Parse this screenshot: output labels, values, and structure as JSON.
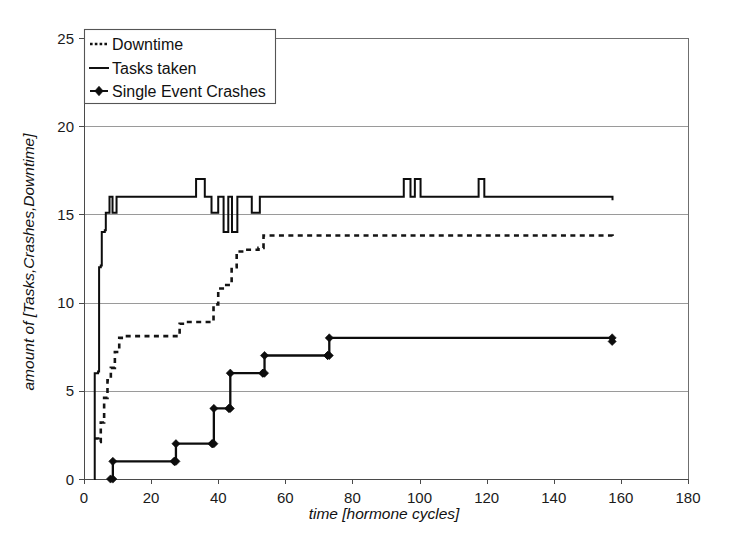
{
  "chart_data": {
    "type": "line",
    "title": "",
    "xlabel": "time [hormone cycles]",
    "ylabel": "amount of [Tasks,Crashes,Downtime]",
    "xlim": [
      0,
      180
    ],
    "ylim": [
      0,
      25
    ],
    "xticks": [
      0,
      20,
      40,
      60,
      80,
      100,
      120,
      140,
      160,
      180
    ],
    "yticks": [
      0,
      5,
      10,
      15,
      20,
      25
    ],
    "grid": "horizontal",
    "legend_position": "top-left",
    "series": [
      {
        "name": "Downtime",
        "style": "dotted",
        "marker": "none",
        "step": "post",
        "points": [
          [
            3.0,
            2.3
          ],
          [
            4.2,
            2.1
          ],
          [
            5.0,
            3.2
          ],
          [
            6.0,
            4.6
          ],
          [
            7.0,
            5.6
          ],
          [
            8.0,
            6.3
          ],
          [
            9.2,
            7.2
          ],
          [
            10.5,
            8.0
          ],
          [
            11.8,
            8.1
          ],
          [
            27.0,
            8.1
          ],
          [
            28.5,
            8.8
          ],
          [
            30.0,
            8.9
          ],
          [
            37.5,
            8.9
          ],
          [
            38.6,
            9.9
          ],
          [
            40.0,
            10.8
          ],
          [
            42.0,
            11.0
          ],
          [
            44.0,
            12.0
          ],
          [
            45.5,
            12.9
          ],
          [
            48.0,
            13.0
          ],
          [
            52.0,
            13.1
          ],
          [
            53.5,
            13.8
          ],
          [
            157.5,
            13.75
          ]
        ]
      },
      {
        "name": "Tasks taken",
        "style": "solid",
        "marker": "none",
        "step": "post",
        "points": [
          [
            3.0,
            0.0
          ],
          [
            3.2,
            6.0
          ],
          [
            4.2,
            6.1
          ],
          [
            4.5,
            12.0
          ],
          [
            5.0,
            12.1
          ],
          [
            5.3,
            14.0
          ],
          [
            6.2,
            14.1
          ],
          [
            6.5,
            15.1
          ],
          [
            7.3,
            15.1
          ],
          [
            7.6,
            16.0
          ],
          [
            8.3,
            16.0
          ],
          [
            8.5,
            15.1
          ],
          [
            9.4,
            15.1
          ],
          [
            9.7,
            16.0
          ],
          [
            33.0,
            16.0
          ],
          [
            33.4,
            17.0
          ],
          [
            35.6,
            17.0
          ],
          [
            36.0,
            16.0
          ],
          [
            37.6,
            16.0
          ],
          [
            38.0,
            15.1
          ],
          [
            39.6,
            15.1
          ],
          [
            40.0,
            16.0
          ],
          [
            41.3,
            16.0
          ],
          [
            41.6,
            14.0
          ],
          [
            42.6,
            14.0
          ],
          [
            43.0,
            16.0
          ],
          [
            43.8,
            16.0
          ],
          [
            44.1,
            14.0
          ],
          [
            45.3,
            14.0
          ],
          [
            45.7,
            16.0
          ],
          [
            49.6,
            16.0
          ],
          [
            50.0,
            15.1
          ],
          [
            52.0,
            15.1
          ],
          [
            52.4,
            16.0
          ],
          [
            95.0,
            16.0
          ],
          [
            95.3,
            17.0
          ],
          [
            97.0,
            17.0
          ],
          [
            97.3,
            16.0
          ],
          [
            98.3,
            16.0
          ],
          [
            98.6,
            17.0
          ],
          [
            100.0,
            17.0
          ],
          [
            100.3,
            16.0
          ],
          [
            117.3,
            16.0
          ],
          [
            117.6,
            17.0
          ],
          [
            119.0,
            17.0
          ],
          [
            119.3,
            16.0
          ],
          [
            157.5,
            15.8
          ]
        ]
      },
      {
        "name": "Single Event Crashes",
        "style": "solid",
        "marker": "diamond",
        "step": "post",
        "points": [
          [
            7.9,
            0
          ],
          [
            8.6,
            1
          ],
          [
            26.9,
            1
          ],
          [
            27.4,
            2
          ],
          [
            38.2,
            2
          ],
          [
            38.7,
            4
          ],
          [
            43.2,
            4
          ],
          [
            43.6,
            6
          ],
          [
            53.3,
            6
          ],
          [
            53.8,
            7
          ],
          [
            72.6,
            7
          ],
          [
            73.1,
            8
          ],
          [
            157.4,
            7.8
          ]
        ]
      }
    ]
  },
  "axes": {
    "y_tick_labels": [
      "0",
      "5",
      "10",
      "15",
      "20",
      "25"
    ],
    "x_tick_labels": [
      "0",
      "20",
      "40",
      "60",
      "80",
      "100",
      "120",
      "140",
      "160",
      "180"
    ],
    "x_axis_title": "time [hormone cycles]",
    "y_axis_title": "amount of [Tasks,Crashes,Downtime]"
  },
  "legend": {
    "items": [
      {
        "label": "Downtime",
        "swatch": "dotted-line-icon"
      },
      {
        "label": "Tasks taken",
        "swatch": "solid-line-icon"
      },
      {
        "label": "Single Event Crashes",
        "swatch": "diamond-marker-line-icon"
      }
    ]
  },
  "colors": {
    "series": "#0d0d0d",
    "grid": "#9a9a9a",
    "frame": "#6f6f6f",
    "background": "#ffffff",
    "text": "#111111"
  }
}
